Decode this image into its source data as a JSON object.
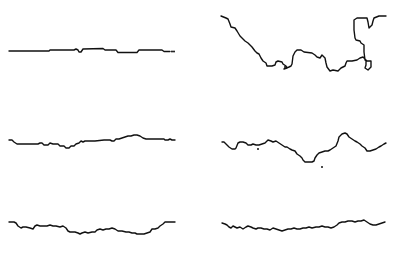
{
  "canvas": {
    "width": 402,
    "height": 253,
    "background": "#ffffff",
    "stroke": "#111111"
  },
  "panels": [
    {
      "id": "top-left",
      "points": [
        [
          9,
          51
        ],
        [
          49,
          51
        ],
        [
          50,
          50
        ],
        [
          74,
          50
        ],
        [
          76,
          49
        ],
        [
          78,
          50
        ],
        [
          79,
          52
        ],
        [
          81,
          52
        ],
        [
          83,
          49
        ],
        [
          103,
          48.5
        ],
        [
          105,
          50
        ],
        [
          116,
          50
        ],
        [
          118,
          52.5
        ],
        [
          137,
          52.5
        ],
        [
          139,
          50
        ],
        [
          162,
          50
        ],
        [
          164,
          51.5
        ],
        [
          170,
          51.5
        ]
      ],
      "tail_dots": [
        [
          172,
          51.5
        ],
        [
          174,
          51.5
        ]
      ],
      "dots": []
    },
    {
      "id": "top-right",
      "points": [
        [
          221,
          16
        ],
        [
          226,
          18
        ],
        [
          228,
          19
        ],
        [
          230,
          24
        ],
        [
          231,
          27
        ],
        [
          235,
          28
        ],
        [
          237,
          31
        ],
        [
          240,
          36
        ],
        [
          242,
          38
        ],
        [
          245,
          41
        ],
        [
          248,
          43
        ],
        [
          252,
          47
        ],
        [
          255,
          51
        ],
        [
          257,
          53
        ],
        [
          259,
          54
        ],
        [
          261,
          58
        ],
        [
          263,
          61
        ],
        [
          266,
          63
        ],
        [
          267,
          66
        ],
        [
          272,
          66
        ],
        [
          275,
          65
        ],
        [
          276,
          62
        ],
        [
          278,
          61
        ],
        [
          282,
          62
        ],
        [
          283,
          64
        ],
        [
          286,
          66
        ],
        [
          287,
          68
        ],
        [
          284,
          69
        ],
        [
          289,
          67
        ],
        [
          291,
          66
        ],
        [
          292,
          64
        ],
        [
          293,
          56
        ],
        [
          295,
          52
        ],
        [
          297,
          50
        ],
        [
          301,
          50
        ],
        [
          304,
          52
        ],
        [
          312,
          53
        ],
        [
          315,
          55
        ],
        [
          317,
          57
        ],
        [
          320,
          58
        ],
        [
          322,
          55
        ],
        [
          325,
          58
        ],
        [
          326,
          63
        ],
        [
          327,
          67
        ],
        [
          330,
          71
        ],
        [
          333,
          70
        ],
        [
          338,
          71
        ],
        [
          341,
          68
        ],
        [
          345,
          66
        ],
        [
          346,
          63
        ],
        [
          347,
          61
        ],
        [
          352,
          61
        ],
        [
          357,
          60
        ],
        [
          360,
          58
        ],
        [
          363,
          57
        ],
        [
          366,
          60
        ],
        [
          366,
          65
        ],
        [
          365,
          68
        ],
        [
          368,
          70
        ],
        [
          371,
          67
        ],
        [
          371,
          61
        ],
        [
          367,
          61
        ],
        [
          365,
          60
        ],
        [
          364,
          52
        ],
        [
          364,
          45
        ],
        [
          361,
          43
        ],
        [
          360,
          41
        ],
        [
          356,
          40
        ],
        [
          355,
          38
        ],
        [
          354,
          30
        ],
        [
          354,
          20
        ],
        [
          357,
          18
        ],
        [
          362,
          18
        ],
        [
          367,
          18
        ],
        [
          368,
          22
        ],
        [
          369,
          28
        ],
        [
          372,
          25
        ],
        [
          373,
          21
        ],
        [
          374,
          18
        ],
        [
          379,
          16
        ],
        [
          386,
          16
        ]
      ],
      "dots": [
        [
          285,
          67
        ]
      ]
    },
    {
      "id": "middle-left",
      "points": [
        [
          9,
          140
        ],
        [
          12,
          140
        ],
        [
          14,
          142
        ],
        [
          17,
          144
        ],
        [
          38,
          144
        ],
        [
          40,
          143
        ],
        [
          42,
          143
        ],
        [
          44,
          145
        ],
        [
          48,
          145
        ],
        [
          50,
          143
        ],
        [
          53,
          144
        ],
        [
          58,
          144
        ],
        [
          60,
          146
        ],
        [
          64,
          146
        ],
        [
          66,
          148
        ],
        [
          69,
          148
        ],
        [
          71,
          146
        ],
        [
          74,
          146
        ],
        [
          76,
          144
        ],
        [
          79,
          143
        ],
        [
          81,
          141
        ],
        [
          83,
          142
        ],
        [
          85,
          141
        ],
        [
          95,
          141
        ],
        [
          104,
          140
        ],
        [
          110,
          140
        ],
        [
          112,
          141
        ],
        [
          114,
          141
        ],
        [
          116,
          139
        ],
        [
          119,
          139
        ],
        [
          122,
          138
        ],
        [
          125,
          137
        ],
        [
          128,
          136
        ],
        [
          131,
          136
        ],
        [
          134,
          135
        ],
        [
          137,
          135
        ],
        [
          140,
          136
        ],
        [
          143,
          138
        ],
        [
          146,
          139
        ],
        [
          160,
          139
        ],
        [
          164,
          139
        ],
        [
          165,
          140
        ],
        [
          168,
          140
        ],
        [
          170,
          139
        ],
        [
          172,
          140
        ],
        [
          175,
          140
        ]
      ],
      "dots": []
    },
    {
      "id": "middle-right",
      "points": [
        [
          222,
          142
        ],
        [
          224,
          142
        ],
        [
          226,
          144
        ],
        [
          229,
          147
        ],
        [
          232,
          149
        ],
        [
          235,
          149
        ],
        [
          236,
          148
        ],
        [
          238,
          143
        ],
        [
          240,
          142
        ],
        [
          243,
          142
        ],
        [
          246,
          143
        ],
        [
          248,
          145
        ],
        [
          251,
          145
        ],
        [
          253,
          144
        ],
        [
          256,
          145
        ],
        [
          259,
          145
        ],
        [
          262,
          144
        ],
        [
          265,
          143
        ],
        [
          268,
          140
        ],
        [
          271,
          141
        ],
        [
          273,
          142
        ],
        [
          276,
          141
        ],
        [
          279,
          143
        ],
        [
          282,
          145
        ],
        [
          285,
          147
        ],
        [
          287,
          147
        ],
        [
          290,
          149
        ],
        [
          292,
          150
        ],
        [
          295,
          151
        ],
        [
          297,
          154
        ],
        [
          300,
          156
        ],
        [
          302,
          158
        ],
        [
          303,
          160
        ],
        [
          305,
          162
        ],
        [
          308,
          162
        ],
        [
          312,
          162
        ],
        [
          314,
          161
        ],
        [
          315,
          158
        ],
        [
          317,
          155
        ],
        [
          319,
          153
        ],
        [
          322,
          152
        ],
        [
          325,
          151
        ],
        [
          328,
          151
        ],
        [
          330,
          150
        ],
        [
          333,
          148
        ],
        [
          336,
          146
        ],
        [
          338,
          141
        ],
        [
          339,
          137
        ],
        [
          342,
          134
        ],
        [
          345,
          133
        ],
        [
          347,
          134
        ],
        [
          349,
          137
        ],
        [
          352,
          139
        ],
        [
          355,
          141
        ],
        [
          357,
          142
        ],
        [
          360,
          144
        ],
        [
          362,
          146
        ],
        [
          365,
          148
        ],
        [
          367,
          151
        ],
        [
          370,
          151
        ],
        [
          373,
          150
        ],
        [
          376,
          149
        ],
        [
          379,
          147
        ],
        [
          381,
          146
        ],
        [
          384,
          144
        ],
        [
          386,
          143
        ]
      ],
      "dots": [
        [
          258,
          149
        ],
        [
          322,
          167
        ]
      ]
    },
    {
      "id": "bottom-left",
      "points": [
        [
          9,
          222
        ],
        [
          14,
          222
        ],
        [
          16,
          223
        ],
        [
          18,
          226
        ],
        [
          21,
          228
        ],
        [
          23,
          227
        ],
        [
          26,
          227
        ],
        [
          30,
          228
        ],
        [
          33,
          229
        ],
        [
          35,
          226
        ],
        [
          37,
          225
        ],
        [
          40,
          226
        ],
        [
          43,
          226
        ],
        [
          47,
          226
        ],
        [
          50,
          225
        ],
        [
          53,
          226
        ],
        [
          56,
          226
        ],
        [
          60,
          227
        ],
        [
          63,
          226
        ],
        [
          66,
          228
        ],
        [
          68,
          231
        ],
        [
          70,
          232
        ],
        [
          75,
          232
        ],
        [
          78,
          233
        ],
        [
          80,
          234
        ],
        [
          82,
          233
        ],
        [
          85,
          232
        ],
        [
          88,
          233
        ],
        [
          92,
          232
        ],
        [
          95,
          232
        ],
        [
          97,
          230
        ],
        [
          100,
          229
        ],
        [
          103,
          230
        ],
        [
          106,
          229
        ],
        [
          109,
          229
        ],
        [
          112,
          228
        ],
        [
          115,
          229
        ],
        [
          118,
          231
        ],
        [
          122,
          231
        ],
        [
          126,
          232
        ],
        [
          129,
          232
        ],
        [
          132,
          233
        ],
        [
          135,
          233
        ],
        [
          137,
          234
        ],
        [
          140,
          234
        ],
        [
          144,
          234
        ],
        [
          147,
          233
        ],
        [
          150,
          232
        ],
        [
          152,
          229
        ],
        [
          155,
          229
        ],
        [
          158,
          228
        ],
        [
          160,
          226
        ],
        [
          163,
          224
        ],
        [
          165,
          222
        ],
        [
          168,
          222
        ],
        [
          172,
          222
        ],
        [
          175,
          222
        ]
      ],
      "dots": []
    },
    {
      "id": "bottom-right",
      "points": [
        [
          222,
          223
        ],
        [
          225,
          224
        ],
        [
          227,
          225
        ],
        [
          229,
          227
        ],
        [
          231,
          228
        ],
        [
          233,
          226
        ],
        [
          235,
          227
        ],
        [
          237,
          228
        ],
        [
          240,
          227
        ],
        [
          243,
          229
        ],
        [
          246,
          227
        ],
        [
          248,
          226
        ],
        [
          251,
          227
        ],
        [
          253,
          228
        ],
        [
          256,
          229
        ],
        [
          258,
          228
        ],
        [
          261,
          228
        ],
        [
          264,
          229
        ],
        [
          267,
          229
        ],
        [
          270,
          230
        ],
        [
          273,
          228
        ],
        [
          276,
          229
        ],
        [
          279,
          230
        ],
        [
          282,
          231
        ],
        [
          285,
          230
        ],
        [
          288,
          229
        ],
        [
          291,
          229
        ],
        [
          294,
          228
        ],
        [
          297,
          229
        ],
        [
          300,
          229
        ],
        [
          303,
          228
        ],
        [
          306,
          228
        ],
        [
          309,
          227
        ],
        [
          312,
          228
        ],
        [
          316,
          227
        ],
        [
          319,
          227
        ],
        [
          322,
          226
        ],
        [
          325,
          227
        ],
        [
          328,
          227
        ],
        [
          331,
          228
        ],
        [
          334,
          227
        ],
        [
          337,
          225
        ],
        [
          339,
          223
        ],
        [
          342,
          222
        ],
        [
          345,
          222
        ],
        [
          348,
          221
        ],
        [
          352,
          221
        ],
        [
          355,
          222
        ],
        [
          358,
          221
        ],
        [
          361,
          221
        ],
        [
          364,
          220
        ],
        [
          367,
          222
        ],
        [
          370,
          224
        ],
        [
          373,
          225
        ],
        [
          376,
          225
        ],
        [
          379,
          224
        ],
        [
          382,
          223
        ],
        [
          385,
          222
        ]
      ],
      "dots": []
    }
  ]
}
